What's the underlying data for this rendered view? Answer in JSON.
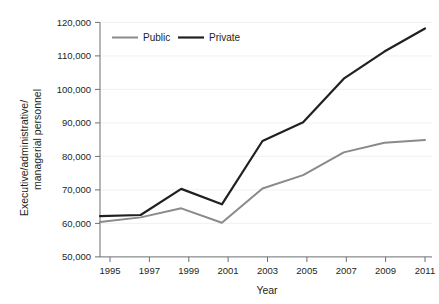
{
  "chart_data": {
    "type": "line",
    "title": "",
    "subtitle": "",
    "xlabel": "Year",
    "ylabel": "Executive/administrative/ managerial personnel",
    "ylabel_line1": "Executive/administrative/",
    "ylabel_line2": "managerial personnel",
    "x": [
      1995,
      1997,
      1999,
      2001,
      2003,
      2005,
      2007,
      2009,
      2011
    ],
    "categories": [
      "1995",
      "1997",
      "1999",
      "2001",
      "2003",
      "2005",
      "2007",
      "2009",
      "2011"
    ],
    "xlim": [
      1995,
      2011
    ],
    "ylim": [
      50000,
      120000
    ],
    "yticks": [
      50000,
      60000,
      70000,
      80000,
      90000,
      100000,
      110000,
      120000
    ],
    "ytick_labels": [
      "50,000",
      "60,000",
      "70,000",
      "80,000",
      "90,000",
      "100,000",
      "110,000",
      "120,000"
    ],
    "grid": true,
    "grid_axis": "y",
    "legend_position": "top-left-inside",
    "series": [
      {
        "name": "Public",
        "color": "#8a8a8a",
        "width": 2,
        "values": [
          60400,
          61800,
          64500,
          60200,
          70400,
          74400,
          81200,
          84100,
          84900
        ]
      },
      {
        "name": "Private",
        "color": "#231f20",
        "width": 2.2,
        "values": [
          62200,
          62500,
          70300,
          65700,
          84600,
          90200,
          103200,
          111300,
          118200
        ]
      }
    ]
  },
  "legend": {
    "items": [
      {
        "label": "Public",
        "color": "#8a8a8a"
      },
      {
        "label": "Private",
        "color": "#231f20"
      }
    ]
  },
  "axes": {
    "x_title": "Year",
    "y_title_line1": "Executive/administrative/",
    "y_title_line2": "managerial personnel",
    "x_tick_labels": [
      "1995",
      "1997",
      "1999",
      "2001",
      "2003",
      "2005",
      "2007",
      "2009",
      "2011"
    ],
    "y_tick_labels": [
      "120,000",
      "110,000",
      "100,000",
      "90,000",
      "80,000",
      "70,000",
      "60,000",
      "50,000"
    ]
  },
  "colors": {
    "background": "#ffffff",
    "public_line": "#8a8a8a",
    "private_line": "#231f20",
    "gridline": "#efefef",
    "axis": "#6d6e71",
    "text": "#231f20"
  }
}
